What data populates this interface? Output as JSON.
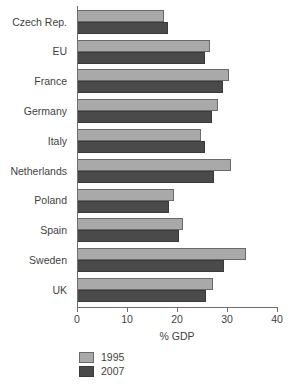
{
  "chart_data": {
    "type": "bar",
    "orientation": "horizontal",
    "title": "",
    "subtitle": "",
    "xlabel": "% GDP",
    "ylabel": "",
    "xlim": [
      0,
      40
    ],
    "xticks": [
      0,
      10,
      20,
      30,
      40
    ],
    "xtick_labels": [
      "0",
      "10",
      "20",
      "30",
      "40"
    ],
    "grid": false,
    "legend_position": "bottom-left",
    "categories": [
      "Czech Rep.",
      "EU",
      "France",
      "Germany",
      "Italy",
      "Netherlands",
      "Poland",
      "Spain",
      "Sweden",
      "UK"
    ],
    "series": [
      {
        "name": "1995",
        "color": "#a9a9a9",
        "values": [
          17.2,
          26.4,
          30.2,
          28.0,
          24.6,
          30.6,
          19.2,
          21.0,
          33.6,
          27.0
        ]
      },
      {
        "name": "2007",
        "color": "#4a4a4a",
        "values": [
          18.0,
          25.4,
          29.0,
          26.8,
          25.4,
          27.2,
          18.2,
          20.2,
          29.2,
          25.6
        ]
      }
    ]
  },
  "legend": {
    "items": [
      {
        "label": "1995",
        "color": "#a9a9a9"
      },
      {
        "label": "2007",
        "color": "#4a4a4a"
      }
    ]
  },
  "axis": {
    "x_title": "% GDP"
  },
  "colors": {
    "series_1995": "#a9a9a9",
    "series_2007": "#4a4a4a",
    "axis_line": "#6e6e6e",
    "text": "#3f3f3f",
    "background": "#ffffff"
  }
}
